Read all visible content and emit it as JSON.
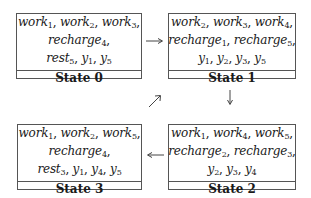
{
  "states": [
    {
      "id": "s0",
      "label": "State 0",
      "lines": [
        [
          [
            "work",
            "1"
          ],
          [
            "work",
            "2"
          ],
          [
            "work",
            "3"
          ]
        ],
        [
          [
            "recharge",
            "4"
          ]
        ],
        [
          [
            "rest",
            "5"
          ],
          [
            "y",
            "1"
          ],
          [
            "y",
            "5"
          ]
        ]
      ],
      "trailing_commas": [
        true,
        true,
        false
      ]
    },
    {
      "id": "s1",
      "label": "State 1",
      "lines": [
        [
          [
            "work",
            "2"
          ],
          [
            "work",
            "3"
          ],
          [
            "work",
            "4"
          ]
        ],
        [
          [
            "recharge",
            "1"
          ],
          [
            "recharge",
            "5"
          ]
        ],
        [
          [
            "y",
            "1"
          ],
          [
            "y",
            "2"
          ],
          [
            "y",
            "3"
          ],
          [
            "y",
            "5"
          ]
        ]
      ],
      "trailing_commas": [
        true,
        true,
        false
      ]
    },
    {
      "id": "s2",
      "label": "State 2",
      "lines": [
        [
          [
            "work",
            "1"
          ],
          [
            "work",
            "4"
          ],
          [
            "work",
            "5"
          ]
        ],
        [
          [
            "recharge",
            "2"
          ],
          [
            "recharge",
            "3"
          ]
        ],
        [
          [
            "y",
            "2"
          ],
          [
            "y",
            "3"
          ],
          [
            "y",
            "4"
          ]
        ]
      ],
      "trailing_commas": [
        true,
        true,
        false
      ]
    },
    {
      "id": "s3",
      "label": "State 3",
      "lines": [
        [
          [
            "work",
            "1"
          ],
          [
            "work",
            "2"
          ],
          [
            "work",
            "5"
          ]
        ],
        [
          [
            "recharge",
            "4"
          ]
        ],
        [
          [
            "rest",
            "3"
          ],
          [
            "y",
            "1"
          ],
          [
            "y",
            "4"
          ],
          [
            "y",
            "5"
          ]
        ]
      ],
      "trailing_commas": [
        true,
        true,
        false
      ]
    }
  ],
  "transitions": [
    {
      "from": "State 0",
      "to": "State 1",
      "direction": "right"
    },
    {
      "from": "State 1",
      "to": "State 2",
      "direction": "down"
    },
    {
      "from": "State 2",
      "to": "State 3",
      "direction": "left"
    },
    {
      "from": "State 3",
      "to": "State 0",
      "direction": "up-right"
    }
  ],
  "colors": {
    "border": "#555555",
    "arrow": "#444444",
    "text": "#1a1a1a"
  }
}
